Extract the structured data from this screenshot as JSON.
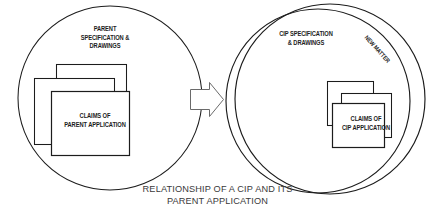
{
  "diagram": {
    "title": "Relationship of a CIP and its Parent Application",
    "caption": {
      "line1": "RELATIONSHIP OF A CIP AND ITS",
      "line2": "PARENT APPLICATION"
    },
    "colors": {
      "stroke": "#1c1c1c",
      "fill": "#ffffff",
      "caption_text": "#3a3a3a",
      "label_text": "#1c1c1c",
      "background": "#ffffff"
    },
    "left_group": {
      "name": "parent-application-circle",
      "spec_label": {
        "line1": "PARENT",
        "line2": "SPECIFICATION &",
        "line3": "DRAWINGS"
      },
      "claims_box": {
        "line1": "CLAIMS OF",
        "line2": "PARENT APPLICATION"
      },
      "stacked_sheet_count": 3
    },
    "arrow": {
      "name": "transition-arrow",
      "direction": "right"
    },
    "right_group": {
      "name": "cip-application-circle",
      "spec_label": {
        "line1": "CIP SPECIFICATION",
        "line2": "& DRAWINGS"
      },
      "new_matter_label": "NEW MATTER",
      "claims_box": {
        "line1": "CLAIMS OF",
        "line2": "CIP APPLICATION"
      },
      "stacked_sheet_count": 3
    }
  }
}
